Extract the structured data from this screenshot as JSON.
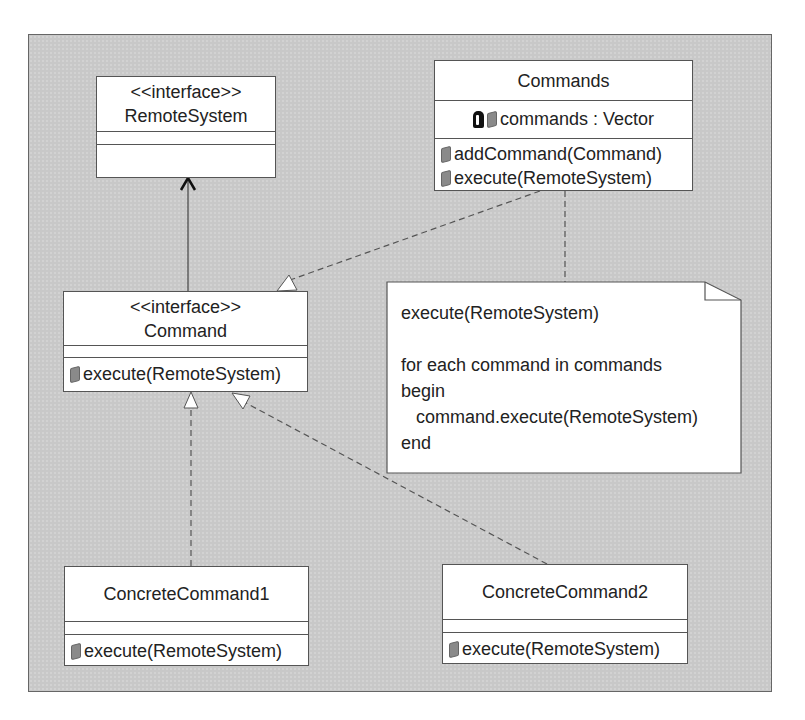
{
  "diagram": {
    "type": "UML class diagram",
    "pattern": "Command"
  },
  "classes": {
    "remote_system": {
      "stereotype": "<<interface>>",
      "name": "RemoteSystem",
      "attributes": [],
      "operations": []
    },
    "commands": {
      "name": "Commands",
      "attributes": [
        {
          "visibility_icon": "lock-icon",
          "text": "commands : Vector"
        }
      ],
      "operations": [
        {
          "text": "addCommand(Command)"
        },
        {
          "text": "execute(RemoteSystem)"
        }
      ]
    },
    "command": {
      "stereotype": "<<interface>>",
      "name": "Command",
      "attributes": [],
      "operations": [
        {
          "text": "execute(RemoteSystem)"
        }
      ]
    },
    "concrete1": {
      "name": "ConcreteCommand1",
      "attributes": [],
      "operations": [
        {
          "text": "execute(RemoteSystem)"
        }
      ]
    },
    "concrete2": {
      "name": "ConcreteCommand2",
      "attributes": [],
      "operations": [
        {
          "text": "execute(RemoteSystem)"
        }
      ]
    }
  },
  "note": {
    "lines": [
      "execute(RemoteSystem)",
      "",
      "for each command in commands",
      "begin",
      "   command.execute(RemoteSystem)",
      "end"
    ]
  },
  "relationships": [
    {
      "from": "Command",
      "to": "RemoteSystem",
      "kind": "association (open arrow)"
    },
    {
      "from": "Commands",
      "to": "Command",
      "kind": "realization (dashed, hollow triangle)"
    },
    {
      "from": "ConcreteCommand1",
      "to": "Command",
      "kind": "realization (dashed, hollow triangle)"
    },
    {
      "from": "ConcreteCommand2",
      "to": "Command",
      "kind": "realization (dashed, hollow triangle)"
    },
    {
      "from": "Commands",
      "to": "note",
      "kind": "note anchor (dashed)"
    }
  ],
  "colors": {
    "canvas": "#c8c8c8",
    "box_fill": "#ffffff",
    "line": "#555555"
  }
}
